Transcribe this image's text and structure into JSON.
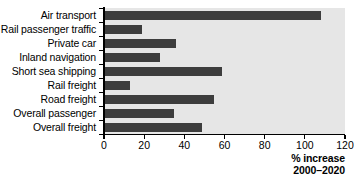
{
  "chart_data": {
    "type": "bar",
    "orientation": "horizontal",
    "title": "",
    "xlabel": "% increase 2000–2020",
    "ylabel": "",
    "categories": [
      "Air transport",
      "Rail passenger traffic",
      "Private car",
      "Inland navigation",
      "Short sea shipping",
      "Rail freight",
      "Road freight",
      "Overall passenger",
      "Overall freight"
    ],
    "values": [
      108,
      19,
      36,
      28,
      59,
      13,
      55,
      35,
      49
    ],
    "xlim": [
      0,
      120
    ],
    "xticks": [
      0,
      20,
      40,
      60,
      80,
      100,
      120
    ],
    "xtick_labels": [
      "0",
      "20",
      "40",
      "60",
      "80",
      "100",
      "120"
    ],
    "grid": false,
    "legend": null,
    "bar_color": "#3d3d3d",
    "plot_background": "#e6e6e6",
    "axis_color": "#000000"
  },
  "caption": {
    "line1": "% increase",
    "line2": "2000–2020"
  }
}
